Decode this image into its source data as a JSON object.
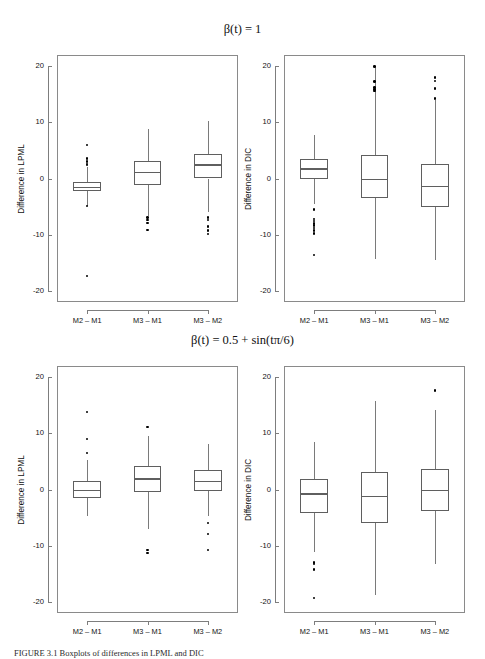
{
  "figure": {
    "caption": "FIGURE 3.1  Boxplots of differences in LPML and DIC"
  },
  "rows": [
    {
      "title": "β(t) = 1"
    },
    {
      "title": "β(t) = 0.5 + sin(tπ/6)"
    }
  ],
  "chart_data": [
    {
      "type": "box",
      "id": "top-left",
      "title": "β(t) = 1",
      "xlabel": "",
      "ylabel": "Difference in LPML",
      "ylim": [
        -22,
        22
      ],
      "yticks": [
        20,
        10,
        0,
        -10,
        -20
      ],
      "categories": [
        "M2 – M1",
        "M3 – M1",
        "M3 – M2"
      ],
      "boxes": [
        {
          "category": "M2 – M1",
          "whisker_low": -4.9,
          "q1": -2.2,
          "median": -1.5,
          "q3": -0.7,
          "whisker_high": 2.0,
          "outliers": [
            6.0,
            3.6,
            3.0,
            2.6,
            2.4,
            -4.9,
            -17.4
          ]
        },
        {
          "category": "M3 – M1",
          "whisker_low": -6.6,
          "q1": -1.1,
          "median": 1.2,
          "q3": 3.1,
          "whisker_high": 8.8,
          "outliers": [
            -7.0,
            -7.4,
            -7.9,
            -9.2
          ]
        },
        {
          "category": "M3 – M2",
          "whisker_low": -6.0,
          "q1": 0.0,
          "median": 2.5,
          "q3": 4.3,
          "whisker_high": 10.2,
          "outliers": [
            -7.0,
            -7.4,
            -8.6,
            -9.3,
            -9.9
          ]
        }
      ]
    },
    {
      "type": "box",
      "id": "top-right",
      "title": "β(t) = 1",
      "xlabel": "",
      "ylabel": "Difference in DIC",
      "ylim": [
        -22,
        22
      ],
      "yticks": [
        20,
        10,
        0,
        -10,
        -20
      ],
      "categories": [
        "M2 – M1",
        "M3 – M1",
        "M3 – M2"
      ],
      "boxes": [
        {
          "category": "M2 – M1",
          "whisker_low": -4.5,
          "q1": -0.1,
          "median": 1.8,
          "q3": 3.5,
          "whisker_high": 7.8,
          "outliers": [
            -5.5,
            -7.2,
            -7.6,
            -8.0,
            -8.4,
            -8.8,
            -9.3,
            -9.8,
            -13.6
          ]
        },
        {
          "category": "M3 – M1",
          "whisker_low": -14.3,
          "q1": -3.4,
          "median": 0.0,
          "q3": 4.1,
          "whisker_high": 20.0,
          "outliers": [
            20.0,
            17.3,
            16.2,
            15.9,
            15.6
          ]
        },
        {
          "category": "M3 – M2",
          "whisker_low": -14.6,
          "q1": -5.1,
          "median": -1.3,
          "q3": 2.6,
          "whisker_high": 14.0,
          "outliers": [
            18.0,
            17.4,
            16.0,
            14.2
          ]
        }
      ]
    },
    {
      "type": "box",
      "id": "bottom-left",
      "title": "β(t) = 0.5 + sin(tπ/6)",
      "xlabel": "",
      "ylabel": "Difference in LPML",
      "ylim": [
        -22,
        22
      ],
      "yticks": [
        20,
        10,
        0,
        -10,
        -20
      ],
      "categories": [
        "M2 – M1",
        "M3 – M1",
        "M3 – M2"
      ],
      "boxes": [
        {
          "category": "M2 – M1",
          "whisker_low": -4.8,
          "q1": -1.5,
          "median": -0.1,
          "q3": 1.5,
          "whisker_high": 5.2,
          "outliers": [
            13.8,
            9.0,
            6.5
          ]
        },
        {
          "category": "M3 – M1",
          "whisker_low": -7.0,
          "q1": -0.5,
          "median": 2.0,
          "q3": 4.2,
          "whisker_high": 9.6,
          "outliers": [
            11.1,
            -10.8,
            -11.3
          ]
        },
        {
          "category": "M3 – M2",
          "whisker_low": -4.8,
          "q1": -0.3,
          "median": 1.6,
          "q3": 3.4,
          "whisker_high": 8.1,
          "outliers": [
            -6.0,
            -7.9,
            -10.8
          ]
        }
      ]
    },
    {
      "type": "box",
      "id": "bottom-right",
      "title": "β(t) = 0.5 + sin(tπ/6)",
      "xlabel": "",
      "ylabel": "Difference in DIC",
      "ylim": [
        -22,
        22
      ],
      "yticks": [
        20,
        10,
        0,
        -10,
        -20
      ],
      "categories": [
        "M2 – M1",
        "M3 – M1",
        "M3 – M2"
      ],
      "boxes": [
        {
          "category": "M2 – M1",
          "whisker_low": -11.2,
          "q1": -4.1,
          "median": -0.7,
          "q3": 1.8,
          "whisker_high": 8.4,
          "outliers": [
            -13.0,
            -13.3,
            -14.2,
            -19.3
          ]
        },
        {
          "category": "M3 – M1",
          "whisker_low": -18.8,
          "q1": -5.9,
          "median": -1.1,
          "q3": 3.1,
          "whisker_high": 15.8,
          "outliers": []
        },
        {
          "category": "M3 – M2",
          "whisker_low": -13.3,
          "q1": -3.9,
          "median": -0.1,
          "q3": 3.6,
          "whisker_high": 14.1,
          "outliers": [
            17.6
          ]
        }
      ]
    }
  ]
}
